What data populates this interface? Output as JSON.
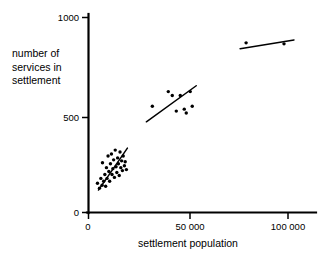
{
  "chart_data": {
    "type": "scatter",
    "title": "",
    "xlabel": "settlement population",
    "ylabel_lines": [
      "number of",
      "services in",
      "settlement"
    ],
    "ylabel": "number of services in settlement",
    "xlim": [
      0,
      113000
    ],
    "ylim": [
      0,
      1020
    ],
    "xticks": [
      0,
      50000,
      100000
    ],
    "xtick_labels": [
      "0",
      "50 000",
      "100 000"
    ],
    "yticks": [
      0,
      500,
      1000
    ],
    "ytick_labels": [
      "0",
      "500",
      "1000"
    ],
    "grid": false,
    "legend": "none",
    "series": [
      {
        "name": "small settlements",
        "points": [
          [
            4500,
            150
          ],
          [
            5500,
            125
          ],
          [
            6200,
            175
          ],
          [
            6800,
            140
          ],
          [
            7000,
            255
          ],
          [
            7600,
            160
          ],
          [
            8200,
            195
          ],
          [
            8600,
            135
          ],
          [
            9000,
            230
          ],
          [
            9300,
            175
          ],
          [
            9800,
            290
          ],
          [
            10200,
            210
          ],
          [
            10600,
            160
          ],
          [
            11000,
            250
          ],
          [
            11500,
            300
          ],
          [
            11800,
            195
          ],
          [
            12200,
            225
          ],
          [
            12600,
            270
          ],
          [
            13000,
            180
          ],
          [
            13400,
            320
          ],
          [
            13800,
            235
          ],
          [
            14200,
            205
          ],
          [
            14600,
            280
          ],
          [
            15000,
            250
          ],
          [
            15400,
            190
          ],
          [
            15800,
            310
          ],
          [
            16200,
            230
          ],
          [
            16600,
            265
          ],
          [
            17000,
            215
          ],
          [
            17400,
            290
          ],
          [
            18000,
            240
          ],
          [
            18400,
            260
          ],
          [
            19000,
            220
          ]
        ],
        "trend": {
          "x1": 5000,
          "y1": 115,
          "x2": 19500,
          "y2": 330
        }
      },
      {
        "name": "medium settlements",
        "points": [
          [
            32000,
            545
          ],
          [
            40000,
            620
          ],
          [
            42000,
            600
          ],
          [
            44000,
            520
          ],
          [
            46000,
            600
          ],
          [
            48000,
            530
          ],
          [
            49000,
            510
          ],
          [
            51000,
            620
          ],
          [
            52000,
            545
          ]
        ],
        "trend": {
          "x1": 29000,
          "y1": 465,
          "x2": 54000,
          "y2": 650
        }
      },
      {
        "name": "large settlements",
        "points": [
          [
            79000,
            870
          ],
          [
            98000,
            865
          ]
        ],
        "trend": {
          "x1": 76000,
          "y1": 840,
          "x2": 103000,
          "y2": 885
        }
      }
    ]
  }
}
